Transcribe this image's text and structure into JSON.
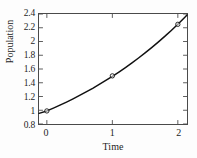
{
  "chart_data": {
    "type": "line",
    "title": "",
    "xlabel": "Time",
    "ylabel": "Population",
    "xlim": [
      -0.12,
      2.14
    ],
    "ylim": [
      0.8,
      2.4
    ],
    "xticks": [
      0,
      1,
      2
    ],
    "xtick_labels": [
      "0",
      "1",
      "2"
    ],
    "yticks": [
      0.8,
      1.0,
      1.2,
      1.4,
      1.6,
      1.8,
      2.0,
      2.2,
      2.4
    ],
    "ytick_labels": [
      "0.8",
      "1",
      "1.2",
      "1.4",
      "1.6",
      "1.8",
      "2",
      "2.2",
      "2.4"
    ],
    "grid": false,
    "legend": null,
    "series": [
      {
        "name": "fitted curve",
        "style": "solid-line",
        "color": "#111111",
        "x": [
          -0.12,
          0.0,
          0.1,
          0.2,
          0.3,
          0.4,
          0.5,
          0.6,
          0.7,
          0.8,
          0.9,
          1.0,
          1.1,
          1.2,
          1.3,
          1.4,
          1.5,
          1.6,
          1.7,
          1.8,
          1.9,
          2.0,
          2.1,
          2.14
        ],
        "y": [
          0.955,
          0.99,
          1.031,
          1.074,
          1.119,
          1.166,
          1.215,
          1.266,
          1.319,
          1.375,
          1.433,
          1.493,
          1.556,
          1.621,
          1.689,
          1.76,
          1.834,
          1.911,
          1.991,
          2.074,
          2.161,
          2.251,
          2.345,
          2.384
        ]
      },
      {
        "name": "observed data",
        "style": "open-circle-markers",
        "color": "#111111",
        "x": [
          0,
          1,
          2
        ],
        "y": [
          0.99,
          1.5,
          2.25
        ]
      }
    ]
  },
  "axes": {
    "tick_direction": "in",
    "spines": [
      "left",
      "right",
      "top",
      "bottom"
    ],
    "frame_color": "#4a4a4a"
  }
}
